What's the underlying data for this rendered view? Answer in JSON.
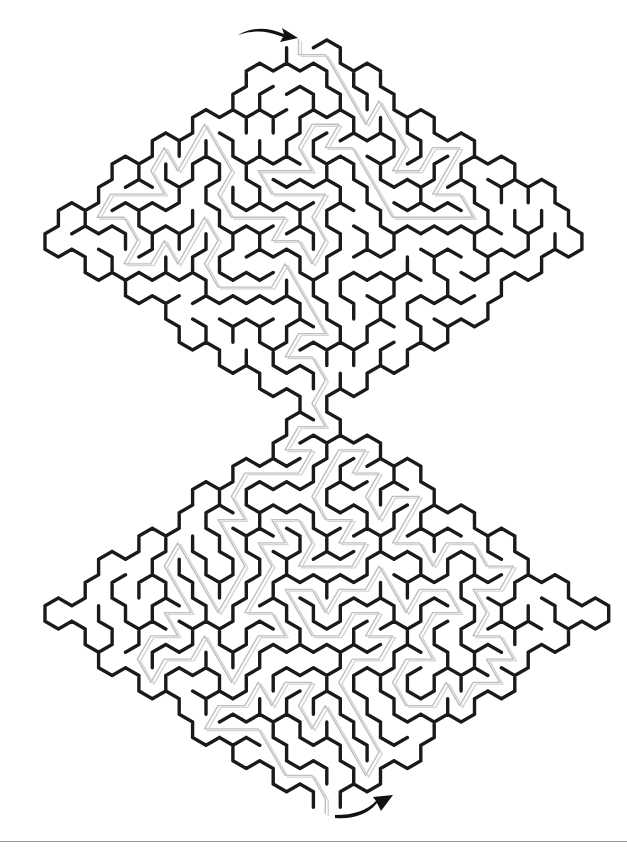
{
  "puzzle": {
    "type": "hexagonal-maze",
    "shape": "double-diamond (hourglass)",
    "entry_label": "",
    "exit_label": "",
    "colors": {
      "background": "#ffffff",
      "wall": "#1a1a1a",
      "solution": "#b8b8b8",
      "arrow": "#111111",
      "rule": "#9a9a9a"
    },
    "geometry": {
      "top_diamond": {
        "top": [
          300,
          40
        ],
        "left": [
          35,
          245
        ],
        "right": [
          595,
          245
        ],
        "bottom": [
          300,
          420
        ]
      },
      "bottom_diamond": {
        "top": [
          300,
          410
        ],
        "left": [
          45,
          610
        ],
        "right": [
          600,
          605
        ],
        "bottom": [
          320,
          815
        ]
      }
    },
    "entry_arrow": {
      "from": [
        238,
        35
      ],
      "to": [
        298,
        38
      ]
    },
    "exit_arrow": {
      "from": [
        335,
        818
      ],
      "to": [
        393,
        795
      ]
    }
  }
}
